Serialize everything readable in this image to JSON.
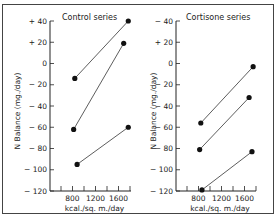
{
  "chart_data": [
    {
      "type": "line",
      "title": "Control series",
      "xlabel": "kcal./sq. m./day",
      "ylabel": "N Balance (mg./day)",
      "xlim": [
        400,
        1800
      ],
      "ylim": [
        -120,
        40
      ],
      "xticks": [
        600,
        800,
        1000,
        1200,
        1400,
        1600,
        1800
      ],
      "xtick_labels": [
        "800",
        "1200",
        "1600"
      ],
      "yticks": [
        40,
        20,
        0,
        -20,
        -40,
        -60,
        -80,
        -100,
        -120
      ],
      "ytick_labels": [
        "+ 40",
        "+ 20",
        "0",
        "− 20",
        "− 40",
        "− 60",
        "− 80",
        "− 100",
        "− 120"
      ],
      "grid": false,
      "series": [
        {
          "name": "Subject 1",
          "x": [
            840,
            1770
          ],
          "y": [
            -14,
            40
          ]
        },
        {
          "name": "Subject 2",
          "x": [
            820,
            1690
          ],
          "y": [
            -62,
            19
          ]
        },
        {
          "name": "Subject 3",
          "x": [
            880,
            1770
          ],
          "y": [
            -95,
            -60
          ]
        }
      ]
    },
    {
      "type": "line",
      "title": "Cortisone series",
      "xlabel": "kcal./sq. m./day",
      "ylabel": "N Balance (mg./day)",
      "xlim": [
        400,
        1800
      ],
      "ylim": [
        -120,
        40
      ],
      "xticks": [
        600,
        800,
        1000,
        1200,
        1400,
        1600,
        1800
      ],
      "xtick_labels": [
        "800",
        "1200",
        "1600"
      ],
      "yticks": [
        40,
        20,
        0,
        -20,
        -40,
        -60,
        -80,
        -100,
        -120
      ],
      "ytick_labels": [
        "− 40",
        "+ 20",
        "0",
        "− 20",
        "− 40",
        "− 60",
        "− 80",
        "− 100",
        "− 120"
      ],
      "grid": false,
      "series": [
        {
          "name": "Subject 1",
          "x": [
            840,
            1750
          ],
          "y": [
            -56,
            -3
          ]
        },
        {
          "name": "Subject 2",
          "x": [
            820,
            1680
          ],
          "y": [
            -81,
            -32
          ]
        },
        {
          "name": "Subject 3",
          "x": [
            860,
            1730
          ],
          "y": [
            -119,
            -83
          ]
        }
      ]
    }
  ],
  "panels": [
    {
      "title": "Control series",
      "xlabel": "kcal./sq. m./day",
      "ylabel": "N Balance (mg./day)"
    },
    {
      "title": "Cortisone series",
      "xlabel": "kcal./sq. m./day",
      "ylabel": "N Balance (mg./day)"
    }
  ]
}
